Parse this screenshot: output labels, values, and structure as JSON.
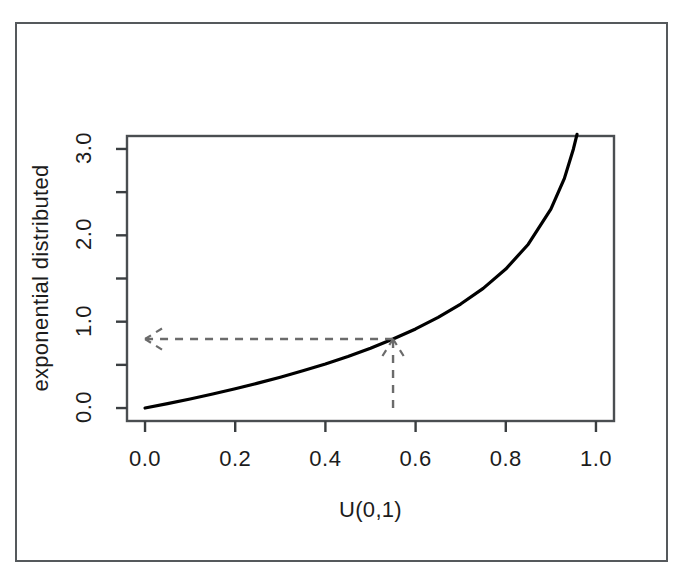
{
  "chart_data": {
    "type": "line",
    "title": "",
    "xlabel": "U(0,1)",
    "ylabel": "exponential distributed",
    "xlim": [
      -0.04,
      1.04
    ],
    "ylim": [
      -0.15,
      3.15
    ],
    "xticks": [
      "0.0",
      "0.2",
      "0.4",
      "0.6",
      "0.8",
      "1.0"
    ],
    "xtick_values": [
      0.0,
      0.2,
      0.4,
      0.6,
      0.8,
      1.0
    ],
    "yticks": [
      "0.0",
      "1.0",
      "2.0",
      "3.0"
    ],
    "ytick_values": [
      0.0,
      1.0,
      2.0,
      3.0
    ],
    "y_minor_ticks": [
      0.5,
      1.5,
      2.5
    ],
    "grid": false,
    "legend": null,
    "series": [
      {
        "name": "inverse exponential CDF",
        "formula": "y = -ln(1 - u)",
        "color": "#000000",
        "linewidth": 3.2,
        "x": [
          0.0,
          0.05,
          0.1,
          0.15,
          0.2,
          0.25,
          0.3,
          0.35,
          0.4,
          0.45,
          0.5,
          0.55,
          0.6,
          0.65,
          0.7,
          0.75,
          0.8,
          0.85,
          0.9,
          0.93,
          0.95,
          0.958
        ],
        "values": [
          0.0,
          0.051,
          0.105,
          0.163,
          0.223,
          0.288,
          0.357,
          0.431,
          0.511,
          0.598,
          0.693,
          0.799,
          0.916,
          1.05,
          1.204,
          1.386,
          1.609,
          1.897,
          2.303,
          2.659,
          3.0,
          3.17
        ]
      }
    ],
    "annotations": [
      {
        "name": "sample-u-value",
        "type": "arrow-vertical",
        "x": 0.55,
        "y_from": 0.0,
        "y_to": 0.799,
        "style": "dashed",
        "arrowhead": "up",
        "color": "#6b6b6b"
      },
      {
        "name": "mapped-exponential-value",
        "type": "arrow-horizontal",
        "y": 0.799,
        "x_from": 0.55,
        "x_to": 0.0,
        "style": "dashed",
        "arrowhead": "left",
        "color": "#6b6b6b"
      }
    ]
  },
  "figure": {
    "caption": "",
    "background": "#ffffff",
    "border_color": "#55595c",
    "axis_color": "#4a4e51"
  }
}
